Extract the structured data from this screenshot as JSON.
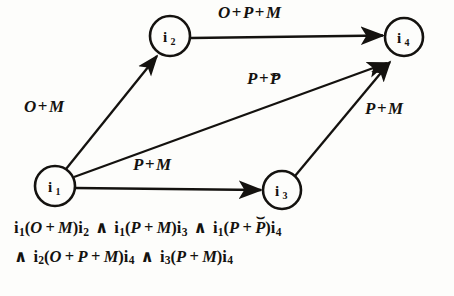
{
  "figure": {
    "type": "directed-graph",
    "background_color": "#fdfdfb",
    "ink_color": "#14120f"
  },
  "nodes": [
    {
      "id": "i1",
      "base": "i",
      "sub": "1",
      "cx": 55,
      "cy": 186,
      "r": 20
    },
    {
      "id": "i2",
      "base": "i",
      "sub": "2",
      "cx": 170,
      "cy": 36,
      "r": 20
    },
    {
      "id": "i3",
      "base": "i",
      "sub": "3",
      "cx": 282,
      "cy": 190,
      "r": 19
    },
    {
      "id": "i4",
      "base": "i",
      "sub": "4",
      "cx": 404,
      "cy": 37,
      "r": 19
    }
  ],
  "edges": [
    {
      "name": "edge-i1-i2",
      "from": "i1",
      "to": "i2",
      "label": "O + M",
      "label_x": 24,
      "label_y": 103,
      "x1": 66,
      "y1": 169,
      "x2": 157,
      "y2": 56
    },
    {
      "name": "edge-i2-i4",
      "from": "i2",
      "to": "i4",
      "label": "O + P + M",
      "label_x": 218,
      "label_y": 6,
      "x1": 190,
      "y1": 38,
      "x2": 384,
      "y2": 35
    },
    {
      "name": "edge-i1-i4",
      "from": "i1",
      "to": "i4",
      "label": "P + P˘",
      "label_has_converse": true,
      "label_x": 247,
      "label_y": 71,
      "x1": 74,
      "y1": 177,
      "x2": 388,
      "y2": 63
    },
    {
      "name": "edge-i1-i3",
      "from": "i1",
      "to": "i3",
      "label": "P + M",
      "label_x": 133,
      "label_y": 158,
      "x1": 75,
      "y1": 188,
      "x2": 262,
      "y2": 190
    },
    {
      "name": "edge-i3-i4",
      "from": "i3",
      "to": "i4",
      "label": "P + M",
      "label_x": 365,
      "label_y": 103,
      "x1": 295,
      "y1": 176,
      "x2": 390,
      "y2": 62
    }
  ],
  "formula": {
    "line1": "i₁(O + M)i₂  ∧  i₁(P + M)i₃  ∧  i₁(P + P˘)i₄",
    "line2": "∧ i₂(O + P + M)i₄  ∧  i₃(P + M)i₄",
    "conjunction_symbol": "∧",
    "terms": [
      {
        "left": "i",
        "left_idx": "1",
        "rel": "O + M",
        "right": "i",
        "right_idx": "2"
      },
      {
        "left": "i",
        "left_idx": "1",
        "rel": "P + M",
        "right": "i",
        "right_idx": "3"
      },
      {
        "left": "i",
        "left_idx": "1",
        "rel": "P + P˘",
        "right": "i",
        "right_idx": "4"
      },
      {
        "left": "i",
        "left_idx": "2",
        "rel": "O + P + M",
        "right": "i",
        "right_idx": "4"
      },
      {
        "left": "i",
        "left_idx": "3",
        "rel": "P + M",
        "right": "i",
        "right_idx": "4"
      }
    ]
  }
}
